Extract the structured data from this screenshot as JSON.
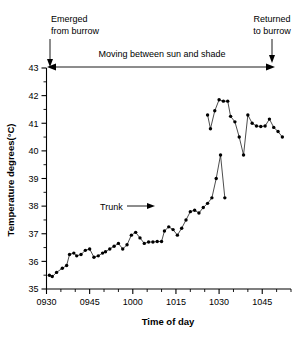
{
  "chart_data": {
    "type": "line",
    "title": "",
    "xlabel": "Time of day",
    "ylabel": "Temperature degrees(°C)",
    "ylim": [
      35,
      43
    ],
    "xlim": [
      930,
      1055
    ],
    "y_ticks": [
      35,
      36,
      37,
      38,
      39,
      40,
      41,
      42,
      43
    ],
    "y_tick_labels": [
      "35",
      "36",
      "37",
      "38",
      "39",
      "40",
      "41",
      "42",
      "43"
    ],
    "y_minor_step": 0.5,
    "x_ticks": [
      930,
      945,
      1000,
      1015,
      1030,
      1045
    ],
    "x_tick_labels": [
      "0930",
      "0945",
      "1000",
      "1015",
      "1030",
      "1045"
    ],
    "x_minor_step": 5,
    "grid": false,
    "legend": "none",
    "series": [
      {
        "name": "Body temperature (segment 1)",
        "x": [
          931,
          932,
          933.5,
          935.5,
          937,
          938,
          939.5,
          940.5,
          942,
          943.5,
          945,
          946.5,
          948,
          949.5,
          950.5,
          952,
          953.5,
          955,
          956.5,
          958,
          959.5,
          961,
          962.5,
          964,
          965.5,
          967,
          968.5,
          970,
          971,
          972.5,
          974,
          975.5,
          977,
          978.5,
          980,
          981.5,
          983,
          984.5,
          986,
          987.5,
          989,
          990.5,
          992,
          993.5,
          995,
          996.5,
          998,
          999.5,
          1001,
          1002.5,
          1004,
          1005.5,
          1007,
          1008.5,
          1010,
          1011.5,
          1013,
          1014.5,
          1016
        ],
        "y": [
          35.5,
          35.45,
          35.6,
          35.75,
          35.85,
          36.25,
          36.3,
          36.2,
          36.25,
          36.4,
          36.45,
          36.15,
          36.2,
          36.3,
          36.35,
          36.45,
          36.55,
          36.65,
          36.45,
          36.6,
          36.95,
          37.05,
          36.85,
          36.65,
          36.7,
          36.7,
          36.72,
          36.72,
          37.1,
          37.25,
          37.15,
          36.95,
          37.2,
          37.5,
          37.8,
          37.85,
          37.75,
          37.95,
          38.1,
          38.3,
          39.0,
          39.85,
          38.3,
          38.3,
          38.3,
          38.3,
          38.3,
          38.3,
          38.3,
          38.3,
          38.3,
          38.3,
          38.3,
          38.3,
          38.3,
          38.3,
          38.3,
          38.3,
          38.3
        ]
      },
      {
        "name": "Body temperature (segment 2)",
        "x": [
          1026,
          1027,
          1028.5,
          1030,
          1031.5,
          1033,
          1034,
          1035.5,
          1037,
          1038.5,
          1040,
          1041.5,
          1043,
          1044.5,
          1046,
          1047.5,
          1049,
          1050.5,
          1052
        ],
        "y": [
          41.3,
          40.8,
          41.45,
          41.85,
          41.8,
          41.8,
          41.25,
          41.05,
          40.5,
          39.85,
          41.3,
          41.0,
          40.9,
          40.88,
          40.9,
          41.15,
          40.85,
          40.7,
          40.5
        ]
      }
    ],
    "annotations": [
      {
        "name": "emerged-from-burrow",
        "text_line1": "Emerged",
        "text_line2": "from burrow",
        "arrow": "down"
      },
      {
        "name": "returned-to-burrow",
        "text_line1": "Returned",
        "text_line2": "to burrow",
        "arrow": "down"
      },
      {
        "name": "moving-between-sun-and-shade",
        "text": "Moving between sun and shade",
        "arrow": "double-headed"
      },
      {
        "name": "trunk",
        "text": "Trunk",
        "arrow": "right"
      }
    ]
  }
}
